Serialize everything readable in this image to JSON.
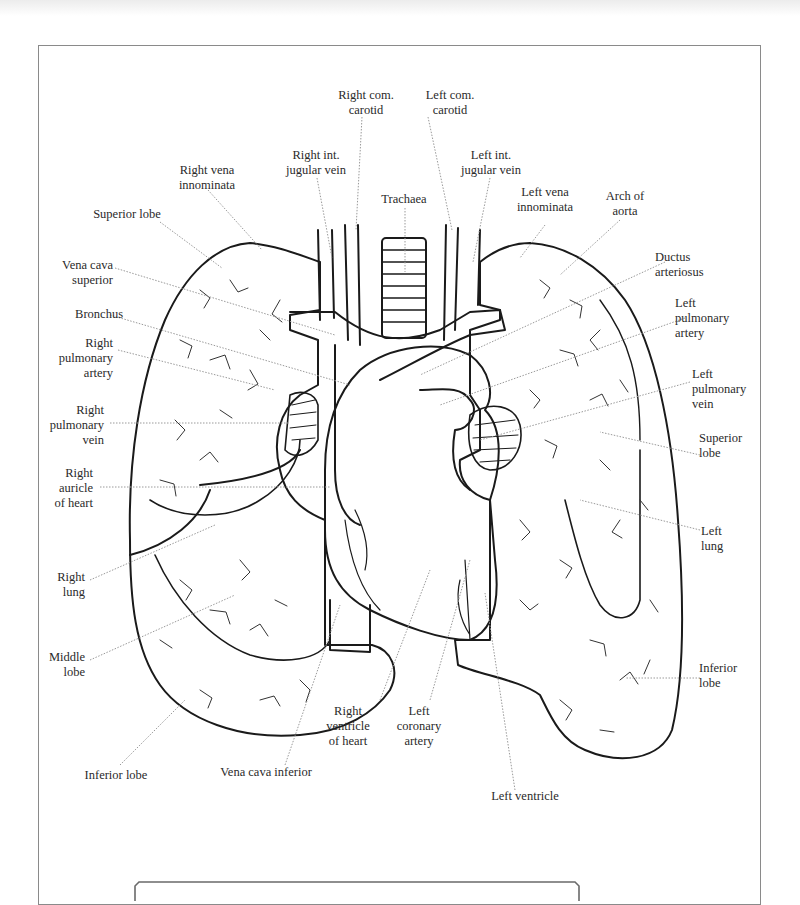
{
  "diagram": {
    "colors": {
      "line": "#1a1a1a",
      "leader": "#9a9a9a",
      "frame": "#8a8a8a",
      "text": "#2a2a2a"
    },
    "labels": {
      "right_com_carotid": "Right com.\ncarotid",
      "left_com_carotid": "Left com.\ncarotid",
      "right_int_jugular_vein": "Right int.\njugular vein",
      "left_int_jugular_vein": "Left int.\njugular vein",
      "right_vena_innominata": "Right vena\ninnominata",
      "trachaea": "Trachaea",
      "left_vena_innominata": "Left vena\ninnominata",
      "arch_of_aorta": "Arch of\naorta",
      "superior_lobe_right": "Superior lobe",
      "vena_cava_superior": "Vena cava\nsuperior",
      "ductus_arteriosus": "Ductus\narteriosus",
      "bronchus": "Bronchus",
      "left_pulmonary_artery": "Left\npulmonary\nartery",
      "right_pulmonary_artery": "Right\npulmonary\nartery",
      "left_pulmonary_vein": "Left\npulmonary\nvein",
      "right_pulmonary_vein": "Right\npulmonary\nvein",
      "superior_lobe_left": "Superior\nlobe",
      "right_auricle": "Right\nauricle\nof heart",
      "left_lung": "Left\nlung",
      "right_lung": "Right\nlung",
      "middle_lobe": "Middle\nlobe",
      "inferior_lobe_left": "Inferior\nlobe",
      "right_ventricle": "Right\nventricle\nof heart",
      "left_coronary_artery": "Left\ncoronary\nartery",
      "inferior_lobe_right": "Inferior lobe",
      "vena_cava_inferior": "Vena cava inferior",
      "left_ventricle": "Left ventricle"
    }
  }
}
